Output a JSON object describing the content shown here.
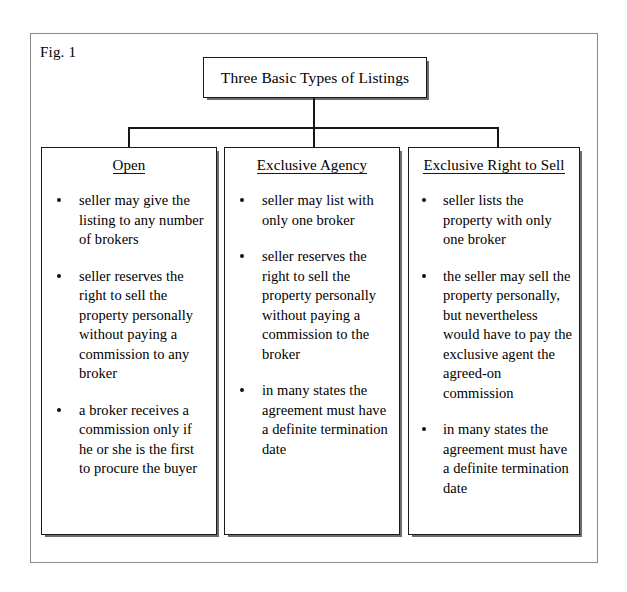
{
  "figure": {
    "label": "Fig. 1",
    "title": "Three Basic Types of Listings"
  },
  "columns": [
    {
      "heading": "Open",
      "bullets": [
        "seller may give the listing to any number of brokers",
        "seller reserves the right to sell the property personally without paying a commission to any broker",
        "a broker receives a commission only if he or she is the first to procure the buyer"
      ]
    },
    {
      "heading": "Exclusive Agency",
      "bullets": [
        "seller may list with only one broker",
        "seller reserves the right to sell the property personally without paying a commission to the broker",
        "in many states the agreement must have a definite termination date"
      ]
    },
    {
      "heading": "Exclusive Right to Sell",
      "bullets": [
        "seller lists the property with only one broker",
        "the seller may sell the property personally, but nevertheless would have to pay the exclusive agent the agreed-on commission",
        "in many states the agreement must have a definite termination date"
      ]
    }
  ]
}
